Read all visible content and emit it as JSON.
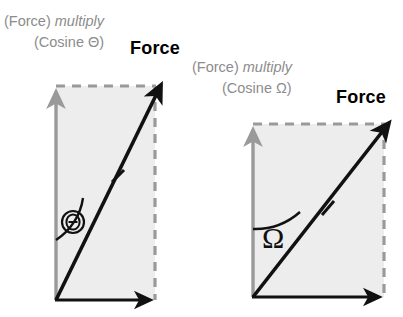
{
  "figure": {
    "title_text_present": false,
    "background_color": "#ffffff",
    "label_gray": "#8c8c8c",
    "fill_gray": "#ededed",
    "arrow_black": "#111111",
    "arrow_gray": "#9a9a9a"
  },
  "diagrams": [
    {
      "id": "left",
      "component_label_line1_prefix": "(Force)",
      "component_label_line1_italic": "multiply",
      "component_label_line2": "(Cosine Θ)",
      "resultant_label": "Force",
      "angle_symbol": "Θ",
      "angle_symbol_name": "theta",
      "angle_symbol_circled": true,
      "tick_marks_on_resultant": 1,
      "vertical_arrow_color": "#9a9a9a",
      "horizontal_arrow_color": "#111111",
      "resultant_arrow_color": "#111111",
      "dashed_border_color": "#9a9a9a",
      "rect_fill": "#ededed"
    },
    {
      "id": "right",
      "component_label_line1_prefix": "(Force)",
      "component_label_line1_italic": "multiply",
      "component_label_line2": "(Cosine Ω)",
      "resultant_label": "Force",
      "angle_symbol": "Ω",
      "angle_symbol_name": "omega",
      "angle_symbol_circled": false,
      "tick_marks_on_resultant": 1,
      "vertical_arrow_color": "#9a9a9a",
      "horizontal_arrow_color": "#111111",
      "resultant_arrow_color": "#111111",
      "dashed_border_color": "#9a9a9a",
      "rect_fill": "#ededed"
    }
  ]
}
